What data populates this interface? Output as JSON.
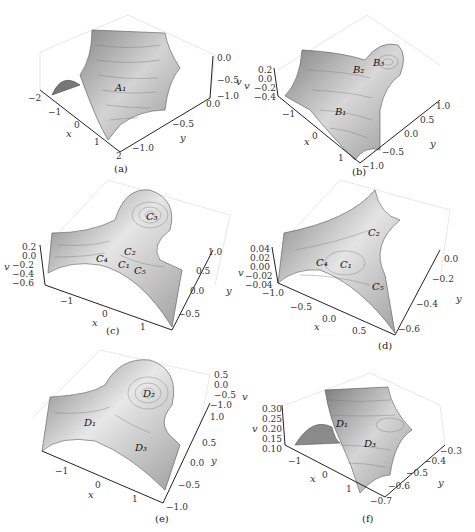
{
  "figure": {
    "panels": [
      {
        "id": "a",
        "caption": "(a)",
        "axes": {
          "x_label": "x",
          "y_label": "y",
          "v_label": "v"
        },
        "x_ticks": [
          "-2",
          "-1",
          "0",
          "1",
          "2"
        ],
        "y_ticks": [
          "-1.0",
          "-0.5",
          "0.0"
        ],
        "v_ticks": [
          "0.0",
          "-0.5",
          "-1.0"
        ],
        "points": [
          "A1"
        ]
      },
      {
        "id": "b",
        "caption": "(b)",
        "axes": {
          "x_label": "x",
          "y_label": "y",
          "v_label": "v"
        },
        "x_ticks": [
          "-1",
          "0",
          "1"
        ],
        "y_ticks": [
          "-1.0",
          "-0.5",
          "0.0",
          "0.5",
          "1.0"
        ],
        "v_ticks": [
          "0.2",
          "0.0",
          "-0.2",
          "-0.4"
        ],
        "points": [
          "B1",
          "B2",
          "B3"
        ]
      },
      {
        "id": "c",
        "caption": "(c)",
        "axes": {
          "x_label": "x",
          "y_label": "y",
          "v_label": "v"
        },
        "x_ticks": [
          "-1",
          "0",
          "1"
        ],
        "y_ticks": [
          "-0.5",
          "0.0",
          "0.5",
          "1.0"
        ],
        "v_ticks": [
          "0.2",
          "0.0",
          "-0.2",
          "-0.4",
          "-0.6"
        ],
        "points": [
          "C1",
          "C2",
          "C3",
          "C4",
          "C5"
        ]
      },
      {
        "id": "d",
        "caption": "(d)",
        "axes": {
          "x_label": "x",
          "y_label": "y",
          "v_label": "v"
        },
        "x_ticks": [
          "-1.0",
          "-0.5",
          "0.0",
          "0.5"
        ],
        "y_ticks": [
          "-0.6",
          "-0.4",
          "-0.2",
          "0.0"
        ],
        "v_ticks": [
          "0.04",
          "0.02",
          "0.00",
          "-0.02",
          "-0.04"
        ],
        "points": [
          "C1",
          "C2",
          "C4",
          "C5"
        ]
      },
      {
        "id": "e",
        "caption": "(e)",
        "axes": {
          "x_label": "x",
          "y_label": "y",
          "v_label": "v"
        },
        "x_ticks": [
          "-1",
          "0",
          "1"
        ],
        "y_ticks": [
          "-1.0",
          "-0.5",
          "0.0",
          "0.5",
          "1.0"
        ],
        "v_ticks": [
          "0.5",
          "0.0",
          "-0.5",
          "-1.0"
        ],
        "points": [
          "D1",
          "D2",
          "D3"
        ]
      },
      {
        "id": "f",
        "caption": "(f)",
        "axes": {
          "x_label": "x",
          "y_label": "y",
          "v_label": "v"
        },
        "x_ticks": [
          "-1",
          "0",
          "1"
        ],
        "y_ticks": [
          "-0.7",
          "-0.6",
          "-0.5",
          "-0.4",
          "-0.3"
        ],
        "v_ticks": [
          "0.30",
          "0.25",
          "0.20",
          "0.15",
          "0.10"
        ],
        "points": [
          "D1",
          "D3"
        ]
      }
    ]
  }
}
